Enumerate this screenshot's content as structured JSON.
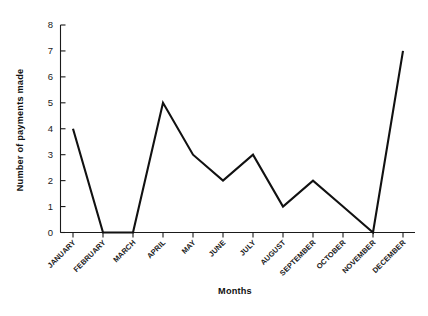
{
  "chart_data": {
    "type": "line",
    "title": "",
    "xlabel": "Months",
    "ylabel": "Number of payments made",
    "categories": [
      "JANUARY",
      "FEBRUARY",
      "MARCH",
      "APRIL",
      "MAY",
      "JUNE",
      "JULY",
      "AUGUST",
      "SEPTEMBER",
      "OCTOBER",
      "NOVEMBER",
      "DECEMBER"
    ],
    "values": [
      4,
      0,
      0,
      5,
      3,
      2,
      3,
      1,
      2,
      1,
      0,
      7
    ],
    "series": [
      {
        "name": "Number of payments made",
        "values": [
          4,
          0,
          0,
          5,
          3,
          2,
          3,
          1,
          2,
          1,
          0,
          7
        ]
      }
    ],
    "ylim": [
      0,
      8
    ],
    "yticks": [
      0,
      1,
      2,
      3,
      4,
      5,
      6,
      7,
      8
    ],
    "ytick_labels": [
      "0",
      "1",
      "2",
      "3",
      "4",
      "5",
      "6",
      "7",
      "8"
    ],
    "grid": false,
    "legend": false,
    "legend_position": "none",
    "markers": false,
    "line_color": "#111111",
    "axis_color": "#1a1a1a",
    "background_color": "#ffffff",
    "xtick_label_rotation": 45
  }
}
